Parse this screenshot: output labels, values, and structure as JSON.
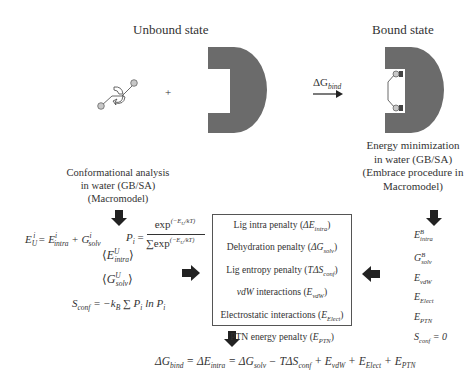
{
  "unbound": {
    "title": "Unbound state",
    "plus": "+"
  },
  "bound": {
    "title": "Bound state"
  },
  "reaction_arrow": {
    "label_prefix": "ΔG",
    "label_sub": "bind"
  },
  "left_caption": {
    "lines": [
      "Conformational analysis",
      "in water (GB/SA)",
      "(Macromodel)"
    ]
  },
  "right_caption": {
    "lines": [
      "Energy minimization",
      "in water (GB/SA)",
      "(Embrace procedure in",
      "Macromodel)"
    ]
  },
  "left_equations": {
    "eu_lhs": "E",
    "eu_lhs_sub": "U",
    "eu_lhs_sup": "i",
    "eu_eq": "= E",
    "eu_intra_sub": "intra",
    "eu_intra_sup": "i",
    "eu_plus": "+ G",
    "eu_solv_sub": "solv",
    "eu_solv_sup": "i",
    "pi_lhs": "P",
    "pi_sub": "i",
    "pi_eq": "=",
    "pi_num": "exp",
    "pi_num_sup": "(−E",
    "pi_num_sup2": "U",
    "pi_num_sup3": "i",
    "pi_num_sup4": "/kT)",
    "pi_den_sum": "∑",
    "pi_den_sum_sub": "i",
    "pi_den": "exp",
    "avg_e": "E",
    "avg_e_sub": "intra",
    "avg_e_sup": "U",
    "avg_g": "G",
    "avg_g_sub": "solv",
    "avg_g_sup": "U",
    "sconf_lhs": "S",
    "sconf_sub": "conf",
    "sconf_eq": "= −k",
    "sconf_kb_sub": "B",
    "sconf_sum": "∑",
    "sconf_sum_sub": "i",
    "sconf_rhs": "P",
    "sconf_rhs_sub": "i",
    "sconf_ln": "ln P",
    "sconf_ln_sub": "i"
  },
  "penalty_box": {
    "items": [
      {
        "label": "Lig intra penalty (",
        "sym": "ΔE",
        "sub": "intra",
        "close": ")"
      },
      {
        "label": "Dehydration penalty (",
        "sym": "ΔG",
        "sub": "solv",
        "close": ")"
      },
      {
        "label": "Lig entropy penalty (",
        "sym": "TΔS",
        "sub": "conf",
        "close": ")"
      },
      {
        "label_italic": "vdW",
        "label": " interactions (",
        "sym": "E",
        "sub": "vdW",
        "close": ")"
      },
      {
        "label": "Electrostatic interactions (",
        "sym": "E",
        "sub": "Elect",
        "close": ")"
      },
      {
        "label": "PTN energy penalty (",
        "sym": "E",
        "sub": "PTN",
        "close": ")"
      }
    ]
  },
  "right_list": {
    "items": [
      {
        "sym": "E",
        "sub": "intra",
        "sup": "B"
      },
      {
        "sym": "G",
        "sub": "solv",
        "sup": "B"
      },
      {
        "sym": "E",
        "sub": "vdW",
        "sup": ""
      },
      {
        "sym": "E",
        "sub": "Elect",
        "sup": ""
      },
      {
        "sym": "E",
        "sub": "PTN",
        "sup": ""
      },
      {
        "sym": "S",
        "sub": "conf",
        "sup": "",
        "tail": " = 0"
      }
    ]
  },
  "final_equation": {
    "parts": [
      {
        "t": "ΔG",
        "sub": "bind"
      },
      {
        "t": " = ΔE",
        "sub": "intra"
      },
      {
        "t": " = ΔG",
        "sub": "solv"
      },
      {
        "t": " − TΔS",
        "sub": "conf"
      },
      {
        "t": " + E",
        "sub": "vdW"
      },
      {
        "t": " + E",
        "sub": "Elect"
      },
      {
        "t": " + E",
        "sub": "PTN"
      }
    ]
  },
  "colors": {
    "protein": "#6b6b6b",
    "ligand_atom": "#c8c8c8",
    "arrow": "#222222",
    "text": "#333333"
  }
}
